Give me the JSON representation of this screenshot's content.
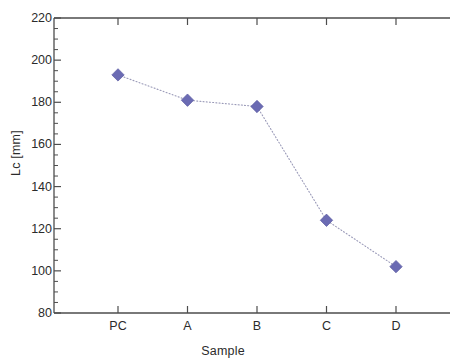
{
  "chart_data": {
    "type": "line",
    "title": "",
    "subtitle": "",
    "xlabel": "Sample",
    "ylabel": "Lc [mm]",
    "categories": [
      "PC",
      "A",
      "B",
      "C",
      "D"
    ],
    "values": [
      193,
      181,
      178,
      124,
      102
    ],
    "series": [
      {
        "name": "Lc",
        "values": [
          193,
          181,
          178,
          124,
          102
        ],
        "marker": "diamond",
        "marker_color": "#6b6bb3",
        "line_style": "dotted",
        "line_color": "#9a9ab8"
      }
    ],
    "ylim": [
      80,
      220
    ],
    "y_major_ticks": [
      80,
      100,
      120,
      140,
      160,
      180,
      200,
      220
    ],
    "y_minor_tick_step": 5,
    "y_tick_labels": [
      "80",
      "100",
      "120",
      "140",
      "160",
      "180",
      "200",
      "220"
    ],
    "x_tick_labels": [
      "PC",
      "A",
      "B",
      "C",
      "D"
    ],
    "grid": false,
    "legend": false,
    "legend_position": "none",
    "frame": "box",
    "tick_direction": "in",
    "axis_color": "#4d4d4d",
    "text_color": "#2b2b2b",
    "background_color": "#ffffff",
    "annotations": []
  }
}
